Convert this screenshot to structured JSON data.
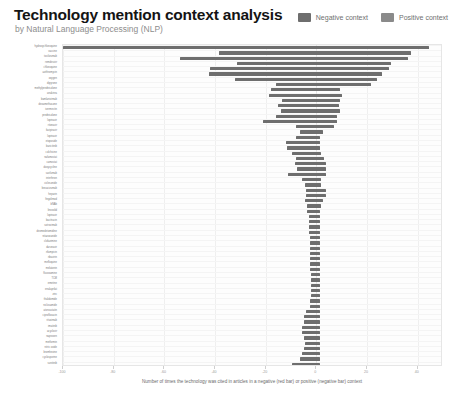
{
  "header": {
    "title": "Technology mention context analysis",
    "subtitle": "by Natural Language Processing (NLP)"
  },
  "legend": {
    "position": "top-right",
    "items": [
      {
        "label": "Negative context",
        "color": "#6e6e6e",
        "icon": "legend-swatch-negative"
      },
      {
        "label": "Positive context",
        "color": "#8a8a8a",
        "icon": "legend-swatch-positive"
      }
    ]
  },
  "chart_data": {
    "type": "bar",
    "orientation": "horizontal",
    "title": "Technology mention context analysis",
    "subtitle": "by Natural Language Processing (NLP)",
    "xlabel": "Number of times the technology was cited in articles in a negative (red bar) or positive (negative bar) context",
    "ylabel": "",
    "xlim": [
      -100,
      50
    ],
    "xticks": [
      -100,
      -80,
      -60,
      -40,
      -20,
      0,
      20,
      40
    ],
    "xticklabels": [
      "-100",
      "-80",
      "-60",
      "-40",
      "-20",
      "0",
      "20",
      "40"
    ],
    "grid": true,
    "bar_color": "#6e6e6e",
    "categories": [
      "hydroxychloroquine",
      "vaccine",
      "tocilizumab",
      "remdesivir",
      "chloroquine",
      "azithromycin",
      "oxygen",
      "dipyrone",
      "methylprednisolone",
      "anakinra",
      "bamlanivimab",
      "dexamethasone",
      "ivermectin",
      "prednisolone",
      "lopinavir",
      "ritonavir",
      "favipiravir",
      "lopinavir",
      "etoposide",
      "baricitinib",
      "colchicine",
      "nafamostat",
      "camostat",
      "doxycycline",
      "sarilumab",
      "interferon",
      "ciclesonide",
      "bevacizumab",
      "heparin",
      "fingolimod",
      "bNAb",
      "linezolid",
      "lopinavir",
      "bacitracin",
      "sotrovimab",
      "dexmedetomidine",
      "nitazoxanide",
      "clofazimine",
      "darunavir",
      "rifampicin",
      "ribavirin",
      "mefloquine",
      "melatonin",
      "fluvoxamine",
      "TCM",
      "emetine",
      "enalaprilat",
      "zinc",
      "thalidomide",
      "niclosamide",
      "atorvastatin",
      "ciprofloxacin",
      "rituximab",
      "imatinib",
      "acyclovir",
      "naproxen",
      "metformin",
      "nitric oxide",
      "bromhexine",
      "cyclosporine",
      "sunitinib"
    ],
    "values": [
      -100.0,
      -38.5,
      -54.0,
      -31.5,
      -42.0,
      -42.5,
      -32.0,
      -16.0,
      -18.0,
      -18.5,
      -13.5,
      -15.0,
      -14.0,
      -16.0,
      -21.0,
      -8.0,
      -6.5,
      -8.0,
      -12.0,
      -11.5,
      -9.5,
      -8.0,
      -8.5,
      -7.5,
      -11.0,
      -5.5,
      -4.5,
      -4.0,
      -4.0,
      -4.5,
      -3.5,
      -3.5,
      -3.0,
      -3.0,
      -3.0,
      -3.0,
      -2.5,
      -2.5,
      -2.5,
      -2.5,
      -2.5,
      -2.5,
      -2.5,
      -2.0,
      -2.0,
      -2.0,
      -2.0,
      -2.0,
      -2.5,
      -2.5,
      -4.0,
      -5.0,
      -5.0,
      -5.5,
      -5.5,
      -5.0,
      -4.5,
      -5.0,
      -5.5,
      -6.5,
      -9.5
    ],
    "positive_values": [
      44.5,
      37.5,
      36.0,
      29.5,
      28.5,
      26.0,
      24.0,
      21.5,
      9.5,
      10.0,
      9.5,
      9.0,
      9.5,
      8.0,
      8.0,
      7.0,
      2.5,
      1.5,
      1.5,
      1.5,
      2.0,
      3.0,
      4.0,
      4.0,
      4.0,
      2.0,
      2.0,
      4.0,
      4.0,
      2.5,
      2.0,
      1.5,
      1.5,
      1.5,
      1.5,
      1.5,
      1.5,
      1.5,
      1.5,
      1.5,
      1.5,
      1.5,
      1.5,
      1.5,
      1.5,
      1.5,
      1.5,
      1.5,
      1.5,
      1.5,
      1.5,
      1.5,
      1.5,
      1.5,
      1.5,
      1.5,
      1.5,
      1.5,
      1.5,
      1.5,
      1.5
    ]
  },
  "axis": {
    "caption": "Number of times the technology was cited in articles in a negative (red bar) or positive (negative bar) context"
  }
}
